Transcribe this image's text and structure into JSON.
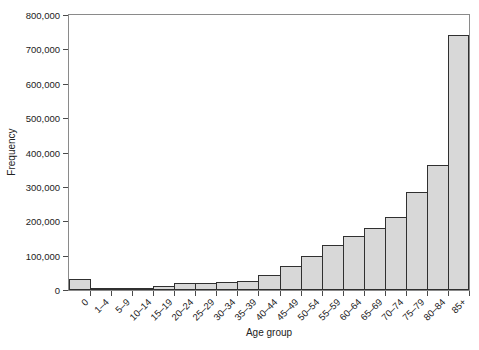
{
  "figure": {
    "background": "#ffffff",
    "bar_fill": "#d8d8d8",
    "bar_border": "#303030",
    "frame_color": "#8a8a8a",
    "tick_color": "#4a4a4a",
    "text_color": "#222222"
  },
  "chart_data": {
    "type": "bar",
    "title": "",
    "xlabel": "Age group",
    "ylabel": "Frequency",
    "categories": [
      "0",
      "1–4",
      "5–9",
      "10–14",
      "15–19",
      "20–24",
      "25–29",
      "30–34",
      "35–39",
      "40–44",
      "45–49",
      "50–54",
      "55–59",
      "60–64",
      "65–69",
      "70–74",
      "75–79",
      "80–84",
      "85+"
    ],
    "values": [
      32000,
      7000,
      3000,
      5000,
      13000,
      21000,
      20000,
      22000,
      27000,
      44000,
      70000,
      99000,
      132000,
      158000,
      180000,
      213000,
      285000,
      364000,
      741000
    ],
    "ylim": [
      0,
      800000
    ],
    "ytick_step": 100000,
    "ytick_labels": [
      "0",
      "100,000",
      "200,000",
      "300,000",
      "400,000",
      "500,000",
      "600,000",
      "700,000",
      "800,000"
    ],
    "grid": false,
    "legend": null,
    "bar_gap": 0,
    "histogram_style": true
  }
}
